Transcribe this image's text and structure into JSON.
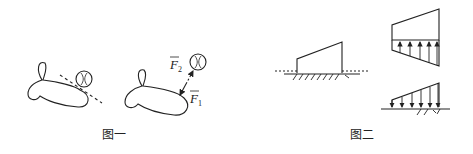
{
  "figure1": {
    "caption": "图一",
    "force_labels": {
      "f1": "F",
      "f1_sub": "1",
      "f2": "F",
      "f2_sub": "2"
    }
  },
  "figure2": {
    "caption": "图二"
  },
  "colors": {
    "stroke": "#222222",
    "background": "#ffffff"
  }
}
